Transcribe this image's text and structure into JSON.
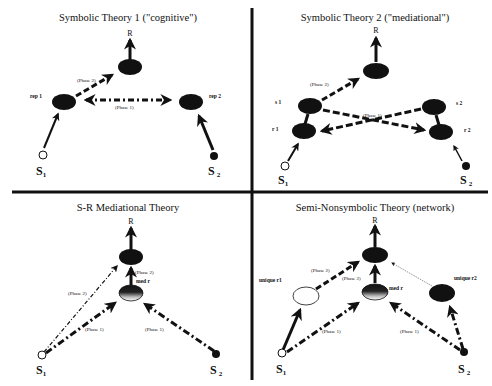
{
  "panels": [
    {
      "title": "Symbolic Theory 1 (\"cognitive\")",
      "response_label": "R",
      "nodes": [
        "rep 1",
        "rep 2"
      ],
      "phase_labels": [
        "(Phase 2)",
        "(Phase 1)"
      ],
      "stimuli": [
        "S",
        "S"
      ],
      "stimuli_subscripts": [
        "1",
        "2"
      ]
    },
    {
      "title": "Symbolic Theory 2 (\"mediational\")",
      "response_label": "R",
      "nodes": [
        "s 1",
        "r 1",
        "s 2",
        "r 2"
      ],
      "phase_labels": [
        "(Phase 2)",
        "(Phase 1)"
      ],
      "stimuli": [
        "S",
        "S"
      ],
      "stimuli_subscripts": [
        "1",
        "2"
      ]
    },
    {
      "title": "S-R Mediational Theory",
      "response_label": "R",
      "nodes": [
        "med r"
      ],
      "phase_labels": [
        "(Phase 2)",
        "(Phase 2)",
        "(Phase 1)",
        "(Phase 1)"
      ],
      "stimuli": [
        "S",
        "S"
      ],
      "stimuli_subscripts": [
        "1",
        "2"
      ]
    },
    {
      "title": "Semi-Nonsymbolic Theory (network)",
      "response_label": "R",
      "nodes": [
        "unique r1",
        "med r",
        "unique r2"
      ],
      "phase_labels": [
        "(Phase 2)",
        "(Phase 2)",
        "(Phase 1)",
        "(Phase 1)"
      ],
      "stimuli": [
        "S",
        "S"
      ],
      "stimuli_subscripts": [
        "1",
        "2"
      ]
    }
  ],
  "colors": {
    "ink": "#111111",
    "background": "#ffffff"
  }
}
